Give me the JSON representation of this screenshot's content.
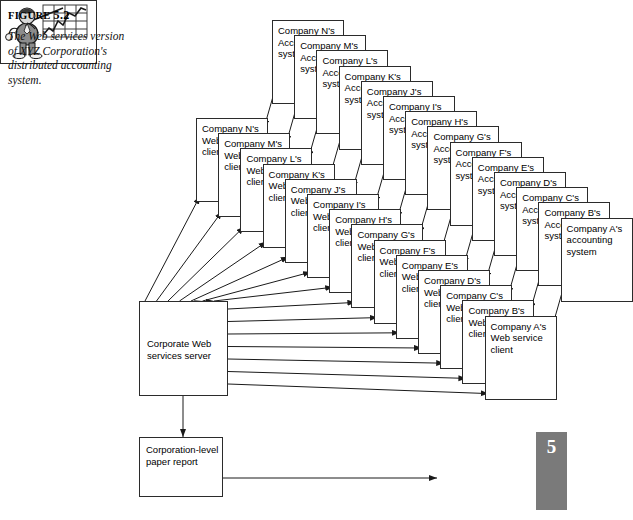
{
  "figure": {
    "label_prefix": "FIGURE",
    "label_number": "5.2",
    "caption": "The Web services version of XYZ Corporation's distributed accounting system."
  },
  "page_marker": {
    "chapter_number": "5"
  },
  "diagram": {
    "server": {
      "label": "Corporate Web services server"
    },
    "report": {
      "label": "Corporation-level paper report"
    },
    "illustration": {
      "name": "businessman-pointing-at-growth-chart"
    },
    "accounting_stack": {
      "suffix_line1": "Accounting",
      "suffix_line2": "system",
      "front_label": "Company A's accounting system",
      "cards": [
        {
          "title": "Company N's"
        },
        {
          "title": "Company M's"
        },
        {
          "title": "Company L's"
        },
        {
          "title": "Company K's"
        },
        {
          "title": "Company J's"
        },
        {
          "title": "Company I's"
        },
        {
          "title": "Company H's"
        },
        {
          "title": "Company G's"
        },
        {
          "title": "Company F's"
        },
        {
          "title": "Company E's"
        },
        {
          "title": "Company D's"
        },
        {
          "title": "Company C's"
        },
        {
          "title": "Company B's"
        },
        {
          "title": "Company A's"
        }
      ]
    },
    "client_stack": {
      "suffix_line1": "Web service",
      "suffix_line2": "client",
      "front_label": "Company A's Web service client",
      "cards": [
        {
          "title": "Company N's"
        },
        {
          "title": "Company M's"
        },
        {
          "title": "Company L's"
        },
        {
          "title": "Company K's"
        },
        {
          "title": "Company J's"
        },
        {
          "title": "Company I's"
        },
        {
          "title": "Company H's"
        },
        {
          "title": "Company G's"
        },
        {
          "title": "Company F's"
        },
        {
          "title": "Company E's"
        },
        {
          "title": "Company D's"
        },
        {
          "title": "Company C's"
        },
        {
          "title": "Company B's"
        },
        {
          "title": "Company A's"
        }
      ]
    }
  }
}
